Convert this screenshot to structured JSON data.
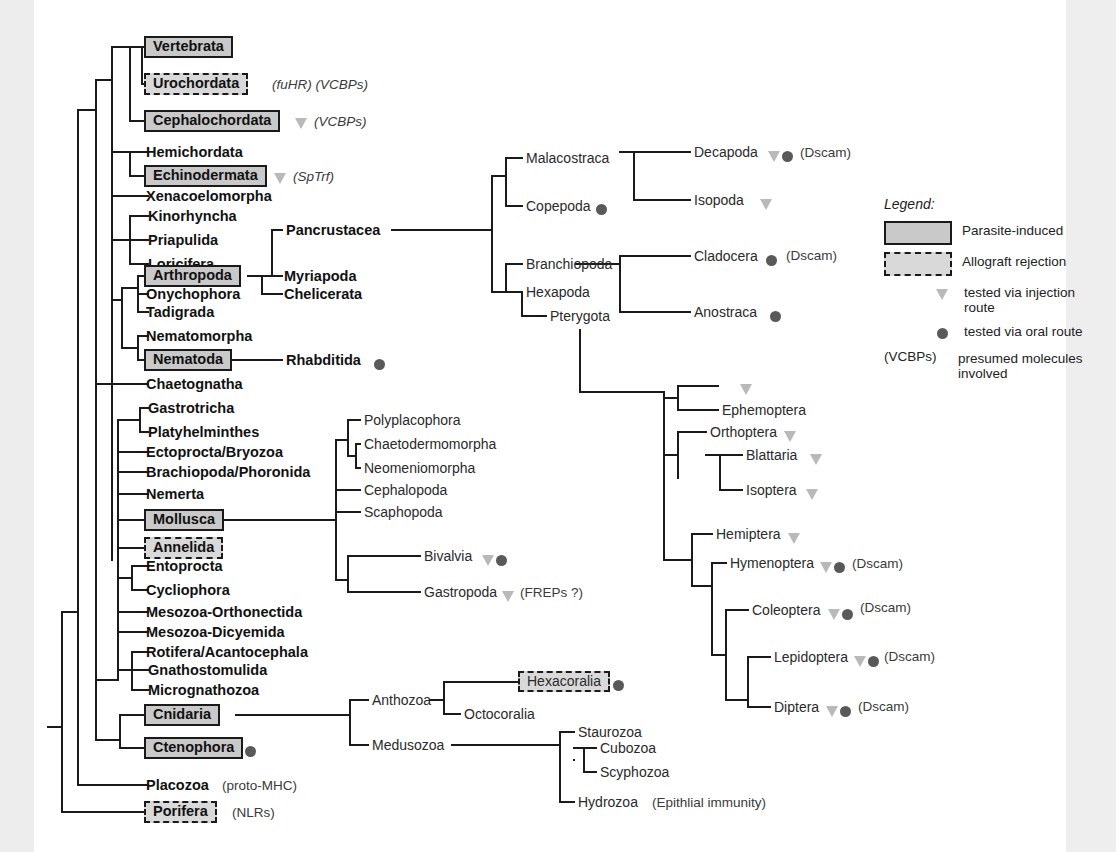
{
  "figure": {
    "type": "phylogenetic-cladogram"
  },
  "legend": {
    "title": "Legend:",
    "entries": [
      {
        "icon": "solid-box-swatch",
        "label": "Parasite-induced"
      },
      {
        "icon": "dashed-box-swatch",
        "label": "Allograft rejection"
      },
      {
        "icon": "triangle-marker",
        "label": "tested via injection route"
      },
      {
        "icon": "circle-marker",
        "label": "tested via oral route"
      },
      {
        "icon": "paren-key",
        "key": "(VCBPs)",
        "label": "presumed molecules involved"
      }
    ]
  },
  "markers": {
    "triangle_meaning": "tested via injection route",
    "circle_meaning": "tested via oral route"
  },
  "colors": {
    "box_fill": "#c9c9c9",
    "dashed_box_fill": "#d9d9d9",
    "line": "#1a1a1a",
    "triangle": "#b9b9b9",
    "circle": "#595959",
    "paper": "#ffffff",
    "margin": "#efefef"
  },
  "taxa": {
    "left_column": [
      {
        "name": "Vertebrata",
        "style": "solid-box",
        "note": ""
      },
      {
        "name": "Urochordata",
        "style": "dashed-box",
        "note": "(fuHR) (VCBPs)"
      },
      {
        "name": "Cephalochordata",
        "style": "solid-box",
        "note": "(VCBPs)",
        "marker": "triangle"
      },
      {
        "name": "Hemichordata",
        "style": "plain-bold",
        "note": ""
      },
      {
        "name": "Echinodermata",
        "style": "solid-box",
        "note": "(SpTrf)",
        "marker": "triangle"
      },
      {
        "name": "Xenacoelomorpha",
        "style": "plain-bold",
        "note": ""
      },
      {
        "name": "Kinorhyncha",
        "style": "plain-bold",
        "note": ""
      },
      {
        "name": "Priapulida",
        "style": "plain-bold",
        "note": ""
      },
      {
        "name": "Loricifera",
        "style": "plain-bold",
        "note": ""
      },
      {
        "name": "Arthropoda",
        "style": "solid-box",
        "note": ""
      },
      {
        "name": "Onychophora",
        "style": "plain-bold",
        "note": ""
      },
      {
        "name": "Tadigrada",
        "style": "plain-bold",
        "note": ""
      },
      {
        "name": "Nematomorpha",
        "style": "plain-bold",
        "note": ""
      },
      {
        "name": "Nematoda",
        "style": "solid-box",
        "note": ""
      },
      {
        "name": "Chaetognatha",
        "style": "plain-bold",
        "note": ""
      },
      {
        "name": "Gastrotricha",
        "style": "plain-bold",
        "note": ""
      },
      {
        "name": "Platyhelminthes",
        "style": "plain-bold",
        "note": ""
      },
      {
        "name": "Ectoprocta/Bryozoa",
        "style": "plain-bold",
        "note": ""
      },
      {
        "name": "Brachiopoda/Phoronida",
        "style": "plain-bold",
        "note": ""
      },
      {
        "name": "Nemerta",
        "style": "plain-bold",
        "note": ""
      },
      {
        "name": "Mollusca",
        "style": "solid-box",
        "note": ""
      },
      {
        "name": "Annelida",
        "style": "dashed-box",
        "note": ""
      },
      {
        "name": "Entoprocta",
        "style": "plain-bold",
        "note": ""
      },
      {
        "name": "Cycliophora",
        "style": "plain-bold",
        "note": ""
      },
      {
        "name": "Mesozoa-Orthonectida",
        "style": "plain-bold",
        "note": ""
      },
      {
        "name": "Mesozoa-Dicyemida",
        "style": "plain-bold",
        "note": ""
      },
      {
        "name": "Rotifera/Acantocephala",
        "style": "plain-bold",
        "note": ""
      },
      {
        "name": "Gnathostomulida",
        "style": "plain-bold",
        "note": ""
      },
      {
        "name": "Micrognathozoa",
        "style": "plain-bold",
        "note": ""
      },
      {
        "name": "Cnidaria",
        "style": "solid-box",
        "note": ""
      },
      {
        "name": "Ctenophora",
        "style": "solid-box",
        "note": "",
        "marker": "circle"
      },
      {
        "name": "Placozoa",
        "style": "plain-bold",
        "note": "(proto-MHC)"
      },
      {
        "name": "Porifera",
        "style": "dashed-box",
        "note": "(NLRs)"
      }
    ],
    "arthropod_sub": [
      {
        "name": "Pancrustacea",
        "style": "plain-bold"
      },
      {
        "name": "Myriapoda",
        "style": "plain-bold"
      },
      {
        "name": "Chelicerata",
        "style": "plain-bold"
      }
    ],
    "nematode_sub": [
      {
        "name": "Rhabditida",
        "style": "plain-bold",
        "marker": "circle"
      }
    ],
    "crustacea": [
      {
        "name": "Malacostraca",
        "style": "plain"
      },
      {
        "name": "Copepoda",
        "style": "plain",
        "marker": "circle"
      },
      {
        "name": "Branchiopoda",
        "style": "plain"
      },
      {
        "name": "Hexapoda",
        "style": "plain"
      },
      {
        "name": "Pterygota",
        "style": "plain"
      }
    ],
    "crustacea_tips": [
      {
        "name": "Decapoda",
        "style": "plain",
        "markers": [
          "triangle",
          "circle"
        ],
        "note": "(Dscam)"
      },
      {
        "name": "Isopoda",
        "style": "plain",
        "markers": [
          "triangle"
        ],
        "note": ""
      },
      {
        "name": "Cladocera",
        "style": "plain",
        "markers": [
          "circle"
        ],
        "note": "(Dscam)"
      },
      {
        "name": "Anostraca",
        "style": "plain",
        "markers": [
          "circle"
        ],
        "note": ""
      }
    ],
    "mollusc_sub": [
      {
        "name": "Polyplacophora",
        "style": "plain"
      },
      {
        "name": "Chaetodermomorpha",
        "style": "plain"
      },
      {
        "name": "Neomeniomorpha",
        "style": "plain"
      },
      {
        "name": "Cephalopoda",
        "style": "plain"
      },
      {
        "name": "Scaphopoda",
        "style": "plain"
      },
      {
        "name": "Bivalvia",
        "style": "plain",
        "markers": [
          "triangle",
          "circle"
        ],
        "note": ""
      },
      {
        "name": "Gastropoda",
        "style": "plain",
        "markers": [
          "triangle"
        ],
        "note": "(FREPs ?)"
      }
    ],
    "insects": [
      {
        "name": "",
        "style": "plain",
        "markers": [
          "triangle"
        ],
        "note": ""
      },
      {
        "name": "Ephemoptera",
        "style": "plain",
        "markers": [],
        "note": ""
      },
      {
        "name": "Orthoptera",
        "style": "plain",
        "markers": [
          "triangle"
        ],
        "note": ""
      },
      {
        "name": "Blattaria",
        "style": "plain",
        "markers": [
          "triangle"
        ],
        "note": ""
      },
      {
        "name": "Isoptera",
        "style": "plain",
        "markers": [
          "triangle"
        ],
        "note": ""
      },
      {
        "name": "Hemiptera",
        "style": "plain",
        "markers": [
          "triangle"
        ],
        "note": ""
      },
      {
        "name": "Hymenoptera",
        "style": "plain",
        "markers": [
          "triangle",
          "circle"
        ],
        "note": "(Dscam)"
      },
      {
        "name": "Coleoptera",
        "style": "plain",
        "markers": [
          "triangle",
          "circle"
        ],
        "note": "(Dscam)"
      },
      {
        "name": "Lepidoptera",
        "style": "plain",
        "markers": [
          "triangle",
          "circle"
        ],
        "note": "(Dscam)"
      },
      {
        "name": "Diptera",
        "style": "plain",
        "markers": [
          "triangle",
          "circle"
        ],
        "note": "(Dscam)"
      }
    ],
    "cnidaria_sub": [
      {
        "name": "Anthozoa",
        "style": "plain"
      },
      {
        "name": "Hexacoralia",
        "style": "dashed-box-plain",
        "marker": "circle"
      },
      {
        "name": "Octocoralia",
        "style": "plain"
      },
      {
        "name": "Medusozoa",
        "style": "plain"
      },
      {
        "name": "Staurozoa",
        "style": "plain"
      },
      {
        "name": "Cubozoa",
        "style": "plain"
      },
      {
        "name": "Scyphozoa",
        "style": "plain"
      },
      {
        "name": "Hydrozoa",
        "style": "plain",
        "note": "(Epithlial immunity)"
      }
    ]
  },
  "notes": {
    "urochordata": "(fuHR) (VCBPs)",
    "cephalochordata": "(VCBPs)",
    "echinodermata": "(SpTrf)",
    "placozoa": "(proto-MHC)",
    "porifera": "(NLRs)",
    "gastropoda": "(FREPs ?)",
    "hydrozoa": "(Epithlial immunity)",
    "dscam": "(Dscam)"
  }
}
